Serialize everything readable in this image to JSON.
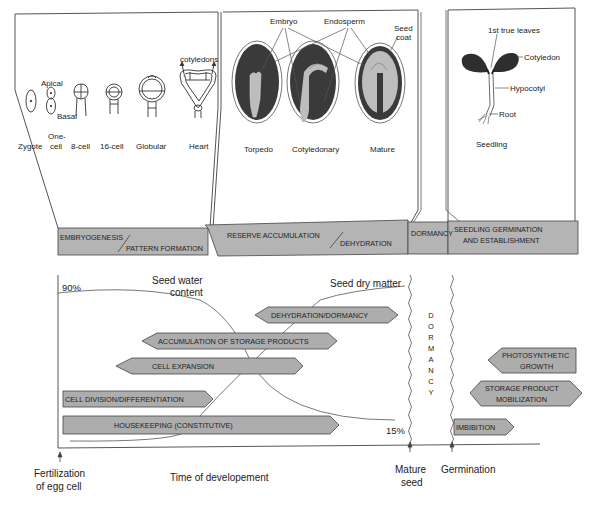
{
  "colors": {
    "bar_fill": "#b4b4b4",
    "arrow_fill": "#adadad",
    "stroke": "#444444",
    "seed_dark": "#3a3a3a",
    "seed_light": "#bdbdbd",
    "background": "#ffffff"
  },
  "top_panels": {
    "embryogenesis": {
      "stages": [
        "Zygote",
        "One-",
        "cell",
        "8-cell",
        "16-cell",
        "Globular",
        "Heart"
      ],
      "labels": {
        "apical": "Apical",
        "basal": "Basal",
        "cotyledons": "cotyledons"
      }
    },
    "reserve": {
      "stages": [
        "Torpedo",
        "Cotyledonary",
        "Mature"
      ],
      "labels": {
        "embryo": "Embryo",
        "endosperm": "Endosperm",
        "seed_coat_1": "Seed",
        "seed_coat_2": "coat"
      }
    },
    "seedling": {
      "stage": "Seedling",
      "labels": {
        "true_leaves": "1st true leaves",
        "cotyledon": "Cotyledon",
        "hypocotyl": "Hypocotyl",
        "root": "Root"
      }
    }
  },
  "phase_bar": {
    "embryogenesis": "EMBRYOGENESIS",
    "pattern_formation": "PATTERN FORMATION",
    "reserve_accumulation": "RESERVE ACCUMULATION",
    "dehydration": "DEHYDRATION",
    "dormancy": "DORMANCY",
    "germination_1": "SEEDLING GERMINATION",
    "germination_2": "AND ESTABLISHMENT"
  },
  "timeline": {
    "water_content_label_1": "Seed water",
    "water_content_label_2": "content",
    "dry_matter_label": "Seed dry matter",
    "pct_high": "90%",
    "pct_low": "15%",
    "dormancy_vertical": [
      "D",
      "O",
      "R",
      "M",
      "A",
      "N",
      "C",
      "Y"
    ],
    "processes": {
      "dehydration_dormancy": "DEHYDRATION/DORMANCY",
      "accumulation": "ACCUMULATION OF STORAGE PRODUCTS",
      "cell_expansion": "CELL EXPANSION",
      "cell_division": "CELL DIVISION/DIFFERENTIATION",
      "housekeeping": "HOUSEKEEPING (CONSTITUTIVE)",
      "photosynthetic_1": "PHOTOSYNTHETIC",
      "photosynthetic_2": "GROWTH",
      "mobilization_1": "STORAGE PRODUCT",
      "mobilization_2": "MOBILIZATION",
      "imbibition": "IMBIBITION"
    },
    "x_axis": {
      "label": "Time of developement",
      "fertilization_1": "Fertilization",
      "fertilization_2": "of egg cell",
      "mature_1": "Mature",
      "mature_2": "seed",
      "germination": "Germination"
    }
  }
}
